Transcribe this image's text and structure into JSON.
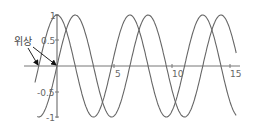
{
  "chart_data": {
    "type": "line",
    "title": "",
    "xlabel": "",
    "ylabel": "",
    "xlim": [
      -1.9,
      15.7
    ],
    "ylim": [
      -1,
      1
    ],
    "grid": false,
    "x_ticks": [
      "5",
      "10",
      "15"
    ],
    "y_ticks": [
      "1",
      "0.5",
      "-0.5",
      "-1"
    ],
    "series": [
      {
        "name": "sin(x)",
        "function": "sin(x)",
        "x_range": [
          -1.7,
          15.5
        ],
        "color": "#666666"
      },
      {
        "name": "sin(x + π/2)",
        "function": "cos(x)",
        "x_range": [
          -1.9,
          15.5
        ],
        "color": "#666666"
      }
    ],
    "annotations": [
      {
        "text": "위상",
        "arrows_to": [
          [
            -1.57,
            0
          ],
          [
            0,
            0
          ]
        ]
      }
    ]
  },
  "labels": {
    "annotation": "위상",
    "xt5": "5",
    "xt10": "10",
    "xt15": "15",
    "yt1": "1",
    "yt05": "0.5",
    "ytm05": "-0.5",
    "ytm1": "-1"
  }
}
